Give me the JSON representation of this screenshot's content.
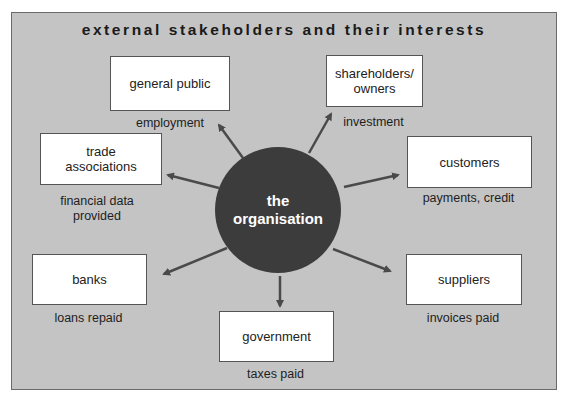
{
  "diagram": {
    "title": "external stakeholders and their interests",
    "center": {
      "line1": "the",
      "line2": "organisation"
    },
    "stakeholders": [
      {
        "name": "general public",
        "interest": "employment"
      },
      {
        "name": "shareholders/ owners",
        "interest": "investment"
      },
      {
        "name": "trade associations",
        "interest": "financial data provided"
      },
      {
        "name": "customers",
        "interest": "payments, credit"
      },
      {
        "name": "banks",
        "interest": "loans repaid"
      },
      {
        "name": "suppliers",
        "interest": "invoices paid"
      },
      {
        "name": "government",
        "interest": "taxes paid"
      }
    ],
    "colors": {
      "background": "#c4c4c4",
      "circle": "#3c3c3c",
      "arrow": "#4a4a4a",
      "box": "#ffffff"
    }
  }
}
